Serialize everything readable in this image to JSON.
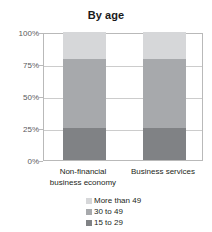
{
  "chart_data": {
    "type": "bar",
    "subtype": "stacked-percentage-column",
    "title": "By age",
    "xlabel": "",
    "ylabel": "",
    "ylim": [
      0,
      100
    ],
    "yticks": [
      0,
      25,
      50,
      75,
      100
    ],
    "ytick_labels": [
      "0%",
      "25%",
      "50%",
      "75%",
      "100%"
    ],
    "grid": true,
    "legend_position": "bottom",
    "categories": [
      "Non-financial business economy",
      "Business services"
    ],
    "category_lines": [
      [
        "Non-financial",
        "business economy"
      ],
      [
        "Business services"
      ]
    ],
    "series": [
      {
        "name": "15 to 29",
        "color": "#808285",
        "values": [
          25,
          25
        ]
      },
      {
        "name": "30 to 49",
        "color": "#a7a9ac",
        "values": [
          54,
          54
        ]
      },
      {
        "name": "More than 49",
        "color": "#d6d7d9",
        "values": [
          21,
          21
        ]
      }
    ],
    "legend_entries": [
      {
        "label": "More than 49",
        "color": "#d6d7d9"
      },
      {
        "label": "30 to 49",
        "color": "#a7a9ac"
      },
      {
        "label": "15 to 29",
        "color": "#808285"
      }
    ],
    "colors": {
      "axis": "#b9b9b9",
      "grid": "#cccccc",
      "text": "#231f20",
      "tick_text": "#59595b",
      "background": "#ffffff"
    }
  }
}
